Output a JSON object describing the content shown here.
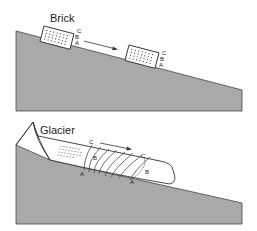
{
  "diagram": {
    "top_panel": {
      "title": "Brick",
      "point_labels": [
        "C",
        "B",
        "A"
      ],
      "motion": "Brick slides down slope as a rigid block; points A, B, C move equally"
    },
    "bottom_panel": {
      "title": "Glacier",
      "start_labels": {
        "top": "C",
        "middle": "B",
        "bottom": "A"
      },
      "end_labels": {
        "top": "C",
        "middle": "B",
        "bottom": "A"
      },
      "motion": "Glacier flows; top (C) moves farther than base (A), deforming vertical line into a curve"
    },
    "colors": {
      "ground": "#a9a9a9",
      "outline": "#333333",
      "ice": "#ffffff"
    }
  }
}
